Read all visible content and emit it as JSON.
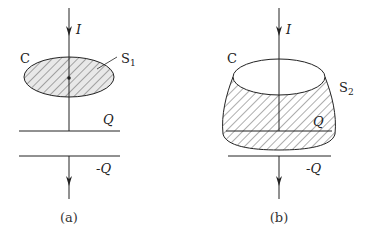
{
  "figure": {
    "panel_a": {
      "caption": "(a)",
      "current_label": "I",
      "curve_label": "C",
      "surface_label": "S",
      "surface_subscript": "1",
      "plate_top_label": "Q",
      "plate_bottom_label": "-Q"
    },
    "panel_b": {
      "caption": "(b)",
      "current_label": "I",
      "curve_label": "C",
      "surface_label": "S",
      "surface_subscript": "2",
      "plate_top_label": "Q",
      "plate_bottom_label": "-Q"
    },
    "colors": {
      "line": "#222222",
      "hatch": "#333333",
      "fill_a": "#e8e8e8",
      "fill_b": "#ffffff"
    }
  }
}
